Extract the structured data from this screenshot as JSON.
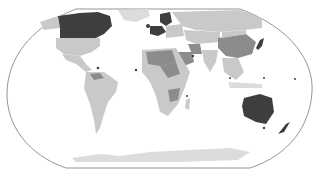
{
  "caption": {
    "text": "",
    "note": "top caption cut off; only lower edge of glyphs visible"
  },
  "map": {
    "projection": "robinson-like",
    "outline_color": "#7a7a7a",
    "ocean_color": "#ffffff",
    "legend_classes": [
      {
        "name": "dark",
        "color": "#3e3e3e"
      },
      {
        "name": "medium",
        "color": "#8c8c8c"
      },
      {
        "name": "light",
        "color": "#c9c9c9"
      },
      {
        "name": "none",
        "color": "#dcdcdc"
      }
    ],
    "highlighted_dark": [
      "Canada",
      "Australia",
      "Japan",
      "United Kingdom",
      "Ireland",
      "Norway",
      "Sweden",
      "Finland",
      "Denmark",
      "Netherlands",
      "Belgium",
      "France",
      "Germany",
      "Qatar",
      "Singapore",
      "New Zealand"
    ],
    "highlighted_medium": [
      "China",
      "Saudi Arabia",
      "Iran",
      "Egypt",
      "Algeria",
      "Mali",
      "Niger",
      "Chad",
      "Sudan",
      "Ethiopia",
      "Tanzania",
      "Zambia",
      "Malawi",
      "Mozambique",
      "Nigeria",
      "Venezuela",
      "Colombia"
    ],
    "light": [
      "United States",
      "Mexico",
      "Brazil",
      "Argentina",
      "Russia",
      "India",
      "Kazakhstan",
      "Mongolia",
      "Southeast Asia",
      "Southern Africa",
      "Antarctica",
      "Greenland"
    ]
  }
}
